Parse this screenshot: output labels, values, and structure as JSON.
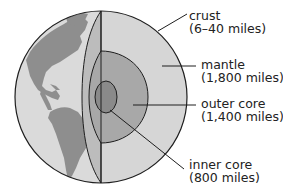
{
  "colors": {
    "outline": "#1e1e1e",
    "land": "#8a8a8a",
    "ocean": "#d9d9d9",
    "crust": "#bdbdbd",
    "mantle": "#d4d4d4",
    "outer_core": "#a9a9a9",
    "inner_core": "#8c8c8c",
    "background": "#ffffff"
  },
  "layers": [
    {
      "id": "crust",
      "name": "crust",
      "thickness": "(6–40 miles)"
    },
    {
      "id": "mantle",
      "name": "mantle",
      "thickness": "(1,800 miles)"
    },
    {
      "id": "outer_core",
      "name": "outer core",
      "thickness": "(1,400 miles)"
    },
    {
      "id": "inner_core",
      "name": "inner core",
      "thickness": "(800 miles)"
    }
  ]
}
